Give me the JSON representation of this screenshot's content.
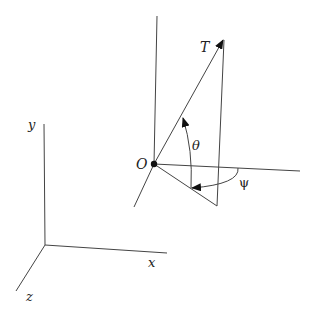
{
  "diagram": {
    "type": "3d-angle-diagram",
    "axes": {
      "x_label": "x",
      "y_label": "y",
      "z_label": "z"
    },
    "origin_label": "O",
    "vector_label": "T",
    "angles": {
      "elevation_label": "θ",
      "azimuth_label": "ψ"
    },
    "colors": {
      "line": "#444444",
      "text": "#222222",
      "background": "#ffffff"
    }
  }
}
